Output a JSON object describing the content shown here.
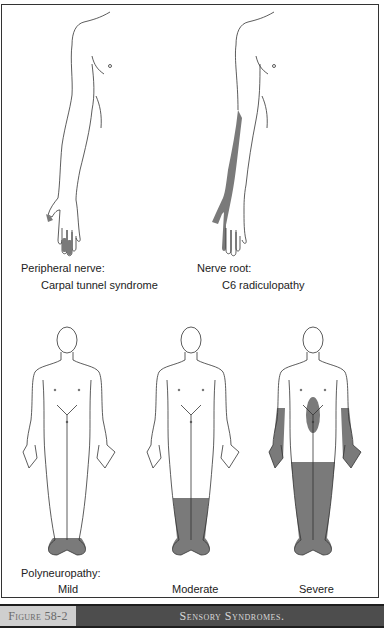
{
  "figure": {
    "panels_top": [
      {
        "heading": "Peripheral nerve:",
        "subheading": "Carpal tunnel syndrome",
        "shaded_region": "thumb, index and middle fingertips"
      },
      {
        "heading": "Nerve root:",
        "subheading": "C6 radiculopathy",
        "shaded_region": "lateral forearm, thumb and index finger"
      }
    ],
    "panels_bottom": {
      "heading": "Polyneuropathy:",
      "items": [
        {
          "label": "Mild",
          "shaded_region": "feet"
        },
        {
          "label": "Moderate",
          "shaded_region": "feet and lower legs"
        },
        {
          "label": "Severe",
          "shaded_region": "legs, forearms, hands, anterior abdomen"
        }
      ]
    },
    "colors": {
      "shading": "#7a7a7a",
      "outline": "#333333",
      "caption_bar": "#4d4d4d",
      "caption_label_bg": "#cfcfcf"
    }
  },
  "caption": {
    "number": "Figure 58-2",
    "title": "Sensory Syndromes."
  }
}
